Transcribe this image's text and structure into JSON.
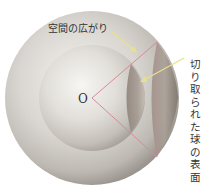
{
  "diagram": {
    "center_label": "O",
    "space_label": "空間の広がり",
    "surface_label": "切り取られた球の表面",
    "colors": {
      "cone_line": "#d9899a",
      "arrow": "#e8e08a",
      "label_text": "#333333"
    }
  }
}
